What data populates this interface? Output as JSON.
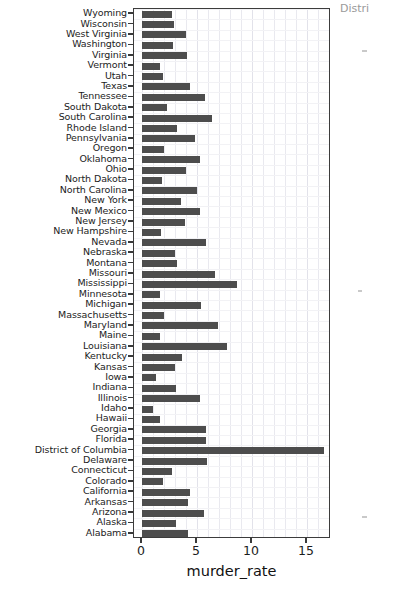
{
  "chart_data": {
    "type": "bar",
    "orientation": "horizontal",
    "title": "",
    "xlabel": "murder_rate",
    "ylabel": "",
    "xlim": [
      0,
      18
    ],
    "ylim": null,
    "xticks": [
      0,
      5,
      10,
      15
    ],
    "xticklabels": [
      "0",
      "5",
      "10",
      "15"
    ],
    "grid": true,
    "legend": null,
    "bar_color": "#4d4d4d",
    "categories": [
      "Wyoming",
      "Wisconsin",
      "West Virginia",
      "Washington",
      "Virginia",
      "Vermont",
      "Utah",
      "Texas",
      "Tennessee",
      "South Dakota",
      "South Carolina",
      "Rhode Island",
      "Pennsylvania",
      "Oregon",
      "Oklahoma",
      "Ohio",
      "North Dakota",
      "North Carolina",
      "New York",
      "New Mexico",
      "New Jersey",
      "New Hampshire",
      "Nevada",
      "Nebraska",
      "Montana",
      "Missouri",
      "Mississippi",
      "Minnesota",
      "Michigan",
      "Massachusetts",
      "Maryland",
      "Maine",
      "Louisiana",
      "Kentucky",
      "Kansas",
      "Iowa",
      "Indiana",
      "Illinois",
      "Idaho",
      "Hawaii",
      "Georgia",
      "Florida",
      "District of Columbia",
      "Delaware",
      "Connecticut",
      "Colorado",
      "California",
      "Arkansas",
      "Arizona",
      "Alaska",
      "Alabama"
    ],
    "values": [
      2.7,
      2.9,
      4.0,
      2.8,
      4.1,
      1.6,
      1.9,
      4.4,
      5.7,
      2.3,
      6.4,
      3.2,
      4.8,
      2.0,
      5.3,
      4.0,
      1.8,
      5.0,
      3.5,
      5.3,
      3.9,
      1.7,
      5.8,
      3.0,
      3.2,
      6.6,
      8.6,
      1.6,
      5.4,
      2.0,
      6.9,
      1.6,
      7.7,
      3.6,
      3.0,
      1.3,
      3.1,
      5.3,
      1.0,
      1.6,
      5.8,
      5.8,
      16.5,
      5.9,
      2.7,
      1.9,
      4.4,
      4.2,
      5.6,
      3.1,
      4.2
    ],
    "value_axis_note": "bar lengths measured against the 0/5/10/15 tick scale"
  },
  "artifacts": {
    "top_right_text": "Distri",
    "note": "faint scan remnants along the right margin"
  }
}
